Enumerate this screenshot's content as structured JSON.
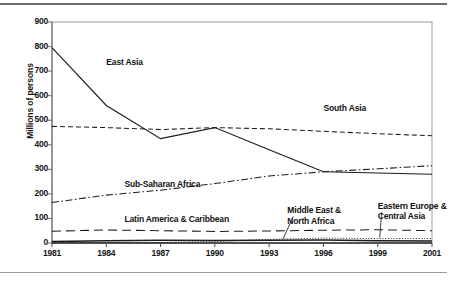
{
  "chart_data": {
    "type": "line",
    "title": "",
    "xlabel": "",
    "ylabel": "Millions of persons",
    "categories": [
      "1981",
      "1984",
      "1987",
      "1990",
      "1993",
      "1996",
      "1999",
      "2001"
    ],
    "ylim": [
      0,
      900
    ],
    "yticks": [
      0,
      100,
      200,
      300,
      400,
      500,
      600,
      700,
      800,
      900
    ],
    "grid": false,
    "legend_position": "inline-annotations",
    "series": [
      {
        "name": "East Asia",
        "style": "solid",
        "values": [
          796,
          560,
          425,
          470,
          380,
          290,
          285,
          280
        ]
      },
      {
        "name": "South Asia",
        "style": "dashed",
        "values": [
          475,
          470,
          462,
          470,
          465,
          455,
          445,
          437
        ]
      },
      {
        "name": "Sub-Saharan Africa",
        "style": "dash-dot",
        "values": [
          165,
          195,
          215,
          242,
          273,
          290,
          302,
          315
        ]
      },
      {
        "name": "Latin America & Caribbean",
        "style": "long-dash",
        "values": [
          48,
          53,
          50,
          47,
          49,
          52,
          54,
          50
        ]
      },
      {
        "name": "Middle East & North Africa",
        "style": "solid-thin",
        "values": [
          6,
          9,
          11,
          10,
          11,
          12,
          9,
          8
        ]
      },
      {
        "name": "Eastern Europe & Central Asia",
        "style": "dotted",
        "values": [
          2,
          2,
          2,
          6,
          15,
          20,
          18,
          18
        ]
      }
    ],
    "annotations": [
      {
        "text": "East Asia",
        "x": 1984,
        "y": 735
      },
      {
        "text": "South Asia",
        "x": 1996,
        "y": 545
      },
      {
        "text": "Sub-Saharan Africa",
        "x": 1985,
        "y": 237
      },
      {
        "text": "Latin America & Caribbean",
        "x": 1985,
        "y": 92
      },
      {
        "text": "Middle East &\nNorth Africa",
        "x": 1994,
        "y": 130
      },
      {
        "text": "Eastern Europe &\nCentral Asia",
        "x": 1999,
        "y": 148
      }
    ]
  }
}
